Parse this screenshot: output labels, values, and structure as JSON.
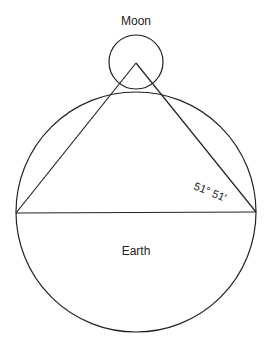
{
  "labels": {
    "moon": "Moon",
    "earth": "Earth",
    "angle": "51° 51′"
  },
  "colors": {
    "stroke": "#222222",
    "background": "#ffffff"
  }
}
